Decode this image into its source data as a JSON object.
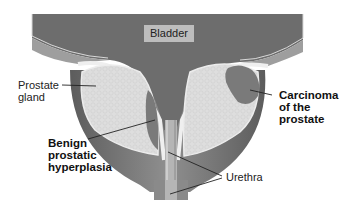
{
  "diagram": {
    "labels": {
      "bladder": "Bladder",
      "prostate_gland_line1": "Prostate",
      "prostate_gland_line2": "gland",
      "bph_line1": "Benign",
      "bph_line2": "prostatic",
      "bph_line3": "hyperplasia",
      "carcinoma_line1": "Carcinoma",
      "carcinoma_line2": "of the",
      "carcinoma_line3": "prostate",
      "urethra": "Urethra"
    },
    "colors": {
      "bladder": "#6e6e6e",
      "wall": "#8a8a8a",
      "wall_light": "#a8a8a8",
      "gland": "#dcdcdc",
      "lining": "#efefef",
      "lesion": "#7c7c7c",
      "urethra": "#b8b8b8"
    }
  }
}
